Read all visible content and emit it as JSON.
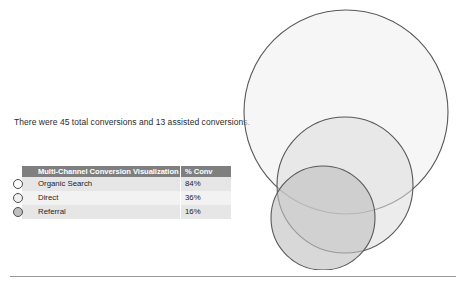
{
  "summary": {
    "text": "There were 45 total conversions and 13 assisted conversions.",
    "total_conversions": 45,
    "assisted_conversions": 13
  },
  "table": {
    "headers": {
      "channel": "Multi-Channel Conversion Visualization",
      "value": "% Conv"
    },
    "rows": [
      {
        "bullet": "circle-marker-outline",
        "channel": "Organic Search",
        "value": "84%"
      },
      {
        "bullet": "circle-marker-outline",
        "channel": "Direct",
        "value": "36%"
      },
      {
        "bullet": "circle-marker-filled",
        "channel": "Referral",
        "value": "16%"
      }
    ],
    "header_bg": "#7f7f7f",
    "header_fg": "#ffffff",
    "row_bg_a": "#e6e6e6",
    "row_bg_b": "#f2f2f2"
  },
  "chart_data": {
    "type": "venn",
    "title": "Multi-Channel Conversion Visualization",
    "categories": [
      "Organic Search",
      "Direct",
      "Referral"
    ],
    "values": [
      84,
      36,
      16
    ],
    "value_labels": [
      "84%",
      "36%",
      "16%"
    ],
    "unit": "% Conv",
    "total_conversions": 45,
    "assisted_conversions": 13,
    "circles": [
      {
        "name": "Organic Search",
        "cx": 110,
        "cy": 112,
        "r": 102,
        "fill": "#eeeeee",
        "stroke": "#585858",
        "opacity": 0.55
      },
      {
        "name": "Direct",
        "cx": 109,
        "cy": 185,
        "r": 68,
        "fill": "#dddddd",
        "stroke": "#585858",
        "opacity": 0.55
      },
      {
        "name": "Referral",
        "cx": 87,
        "cy": 218,
        "r": 52,
        "fill": "#c0c0c0",
        "stroke": "#585858",
        "opacity": 0.62
      }
    ],
    "grid": false,
    "legend": "none",
    "xlabel": "",
    "ylabel": ""
  },
  "icons": {
    "bullet_outline": "circle-outline-icon",
    "bullet_filled": "circle-filled-icon"
  }
}
